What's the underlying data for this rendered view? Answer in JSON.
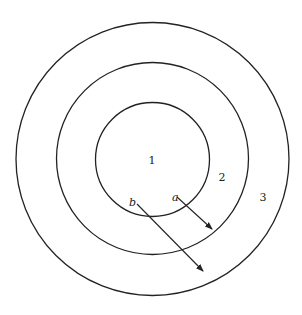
{
  "diagram": {
    "regions": [
      {
        "label": "1",
        "x": 152,
        "y": 164
      },
      {
        "label": "2",
        "x": 222,
        "y": 181
      },
      {
        "label": "3",
        "x": 263,
        "y": 201
      }
    ],
    "circles": [
      {
        "name": "outer",
        "cx": 152.5,
        "cy": 159,
        "r": 136.5
      },
      {
        "name": "middle",
        "cx": 152.5,
        "cy": 158.5,
        "r": 96
      },
      {
        "name": "inner",
        "cx": 152.5,
        "cy": 159.5,
        "r": 57
      }
    ],
    "arrows": [
      {
        "label": "a",
        "label_x": 172,
        "label_y": 201,
        "x1": 177,
        "y1": 197,
        "x2": 212,
        "y2": 229
      },
      {
        "label": "b",
        "label_x": 129,
        "label_y": 206,
        "x1": 137,
        "y1": 204,
        "x2": 203,
        "y2": 271
      }
    ],
    "stroke_color": "#222222"
  }
}
